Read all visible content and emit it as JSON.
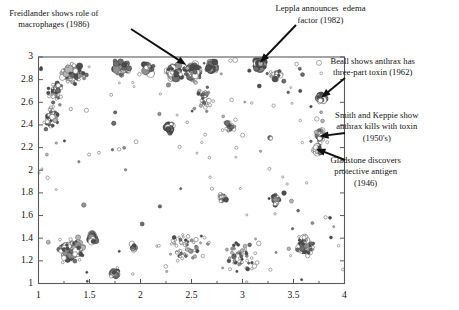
{
  "figure": {
    "type": "bubble-scatter",
    "background": "#ffffff"
  },
  "chart_data": {
    "type": "scatter",
    "title": "",
    "subtitle": "",
    "xlabel": "",
    "ylabel": "",
    "xlim": [
      1,
      4
    ],
    "ylim": [
      1,
      3
    ],
    "grid": false,
    "legend": null,
    "legend_position": "none",
    "x_ticks": [
      1,
      1.5,
      2,
      2.5,
      3,
      3.5,
      4
    ],
    "x_tick_labels": [
      "1",
      "1.5",
      "2",
      "2.5",
      "3",
      "3.5",
      "4"
    ],
    "x_minor_ticks": [
      1.25,
      1.75,
      2.25,
      2.75,
      3.25,
      3.75
    ],
    "y_ticks": [
      1,
      1.2,
      1.4,
      1.6,
      1.8,
      2,
      2.2,
      2.4,
      2.6,
      2.8,
      3
    ],
    "y_tick_labels": [
      "1",
      "1.2",
      "1.4",
      "1.6",
      "1.8",
      "2",
      "2.2",
      "2.4",
      "2.6",
      "2.8",
      "3"
    ],
    "marker_palette": [
      "#4d4d4d",
      "#6e6e6e",
      "#8f8f8f",
      "#b5b5b5",
      "#ffffff"
    ],
    "marker_stroke": "#555555",
    "annotations": [
      {
        "id": "freidlander",
        "text": "Freidlander shows role of\nmacrophages (1986)",
        "text_x": 0.02,
        "text_y": 0.025,
        "point_x": 2.45,
        "point_y": 2.93
      },
      {
        "id": "leppla",
        "text": "Leppla announces  edema\nfactor (1982)",
        "text_x": 0.6,
        "text_y": 0.01,
        "point_x": 3.17,
        "point_y": 2.95
      },
      {
        "id": "beall",
        "text": "Beall shows anthrax has\nthree-part toxin (1962)",
        "text_x": 0.72,
        "text_y": 0.18,
        "point_x": 3.77,
        "point_y": 2.64
      },
      {
        "id": "smith-keppie",
        "text": "Smith and Keppie show\nanthrax kills with toxin\n(1950's)",
        "text_x": 0.73,
        "text_y": 0.355,
        "point_x": 3.75,
        "point_y": 2.3
      },
      {
        "id": "gladstone",
        "text": "Gladstone discovers\nprotective antigen\n(1946)",
        "text_x": 0.72,
        "text_y": 0.5,
        "point_x": 3.72,
        "point_y": 2.19
      }
    ],
    "clusters": [
      {
        "name": "top-left-a",
        "cx": 1.33,
        "cy": 2.86,
        "rx": 0.13,
        "ry": 0.085,
        "n": 120,
        "size": [
          1.4,
          4.2
        ],
        "dark": 0.62
      },
      {
        "name": "top-left-tail",
        "cx": 1.17,
        "cy": 2.7,
        "rx": 0.08,
        "ry": 0.1,
        "n": 45,
        "size": [
          1.2,
          3.0
        ],
        "dark": 0.5
      },
      {
        "name": "left-edge-mid",
        "cx": 1.13,
        "cy": 2.48,
        "rx": 0.07,
        "ry": 0.13,
        "n": 40,
        "size": [
          1.2,
          3.2
        ],
        "dark": 0.45
      },
      {
        "name": "top-b",
        "cx": 1.82,
        "cy": 2.9,
        "rx": 0.1,
        "ry": 0.07,
        "n": 75,
        "size": [
          1.4,
          4.0
        ],
        "dark": 0.6
      },
      {
        "name": "top-c",
        "cx": 2.08,
        "cy": 2.9,
        "rx": 0.07,
        "ry": 0.07,
        "n": 45,
        "size": [
          1.4,
          4.4
        ],
        "dark": 0.62
      },
      {
        "name": "top-d",
        "cx": 2.33,
        "cy": 2.86,
        "rx": 0.09,
        "ry": 0.09,
        "n": 95,
        "size": [
          1.4,
          4.6
        ],
        "dark": 0.6
      },
      {
        "name": "top-e",
        "cx": 2.52,
        "cy": 2.87,
        "rx": 0.09,
        "ry": 0.08,
        "n": 110,
        "size": [
          1.4,
          4.2
        ],
        "dark": 0.5
      },
      {
        "name": "top-f",
        "cx": 2.7,
        "cy": 2.92,
        "rx": 0.06,
        "ry": 0.06,
        "n": 40,
        "size": [
          1.6,
          4.6
        ],
        "dark": 0.58
      },
      {
        "name": "leppla-blob",
        "cx": 3.17,
        "cy": 2.93,
        "rx": 0.06,
        "ry": 0.055,
        "n": 55,
        "size": [
          2.2,
          5.2
        ],
        "dark": 0.85
      },
      {
        "name": "top-right-tail",
        "cx": 3.33,
        "cy": 2.84,
        "rx": 0.09,
        "ry": 0.06,
        "n": 45,
        "size": [
          1.2,
          3.2
        ],
        "dark": 0.4
      },
      {
        "name": "beall-cluster",
        "cx": 3.77,
        "cy": 2.64,
        "rx": 0.05,
        "ry": 0.05,
        "n": 38,
        "size": [
          1.6,
          4.4
        ],
        "dark": 0.55
      },
      {
        "name": "smith-cluster",
        "cx": 3.76,
        "cy": 2.31,
        "rx": 0.05,
        "ry": 0.06,
        "n": 48,
        "size": [
          1.4,
          3.8
        ],
        "dark": 0.4
      },
      {
        "name": "gladstone-cl",
        "cx": 3.73,
        "cy": 2.19,
        "rx": 0.05,
        "ry": 0.05,
        "n": 42,
        "size": [
          1.4,
          3.6
        ],
        "dark": 0.45
      },
      {
        "name": "mid-arc-a",
        "cx": 2.28,
        "cy": 2.38,
        "rx": 0.05,
        "ry": 0.06,
        "n": 28,
        "size": [
          1.4,
          4.2
        ],
        "dark": 0.6
      },
      {
        "name": "mid-arc-b",
        "cx": 2.62,
        "cy": 2.62,
        "rx": 0.09,
        "ry": 0.12,
        "n": 35,
        "size": [
          1.2,
          2.8
        ],
        "dark": 0.38
      },
      {
        "name": "mid-arc-c",
        "cx": 2.88,
        "cy": 2.38,
        "rx": 0.06,
        "ry": 0.06,
        "n": 22,
        "size": [
          1.2,
          3.0
        ],
        "dark": 0.45
      },
      {
        "name": "mid-scatter-d",
        "cx": 2.8,
        "cy": 1.76,
        "rx": 0.05,
        "ry": 0.05,
        "n": 20,
        "size": [
          1.2,
          3.0
        ],
        "dark": 0.55
      },
      {
        "name": "mid-scatter-e",
        "cx": 3.33,
        "cy": 1.74,
        "rx": 0.05,
        "ry": 0.06,
        "n": 26,
        "size": [
          1.2,
          3.2
        ],
        "dark": 0.5
      },
      {
        "name": "bot-left-main",
        "cx": 1.32,
        "cy": 1.3,
        "rx": 0.13,
        "ry": 0.11,
        "n": 150,
        "size": [
          1.3,
          4.4
        ],
        "dark": 0.52
      },
      {
        "name": "bot-left-b",
        "cx": 1.53,
        "cy": 1.4,
        "rx": 0.05,
        "ry": 0.05,
        "n": 30,
        "size": [
          1.6,
          4.8
        ],
        "dark": 0.65
      },
      {
        "name": "bot-left-c",
        "cx": 1.75,
        "cy": 1.09,
        "rx": 0.04,
        "ry": 0.035,
        "n": 24,
        "size": [
          1.6,
          4.6
        ],
        "dark": 0.68
      },
      {
        "name": "bot-left-d",
        "cx": 1.93,
        "cy": 1.32,
        "rx": 0.04,
        "ry": 0.05,
        "n": 22,
        "size": [
          1.3,
          3.4
        ],
        "dark": 0.55
      },
      {
        "name": "bot-right-main",
        "cx": 3.62,
        "cy": 1.33,
        "rx": 0.09,
        "ry": 0.11,
        "n": 90,
        "size": [
          1.3,
          3.8
        ],
        "dark": 0.45
      },
      {
        "name": "bot-mid-sparse",
        "cx": 2.45,
        "cy": 1.35,
        "rx": 0.22,
        "ry": 0.18,
        "n": 55,
        "size": [
          1.1,
          2.6
        ],
        "dark": 0.35
      },
      {
        "name": "bot-mid-sparse2",
        "cx": 3.0,
        "cy": 1.25,
        "rx": 0.18,
        "ry": 0.16,
        "n": 45,
        "size": [
          1.1,
          2.6
        ],
        "dark": 0.35
      }
    ],
    "sparse_field": {
      "n": 210,
      "size": [
        1.0,
        2.6
      ],
      "dark": 0.3,
      "description": "diffuse low-density points filling the interior of the plot box"
    }
  }
}
